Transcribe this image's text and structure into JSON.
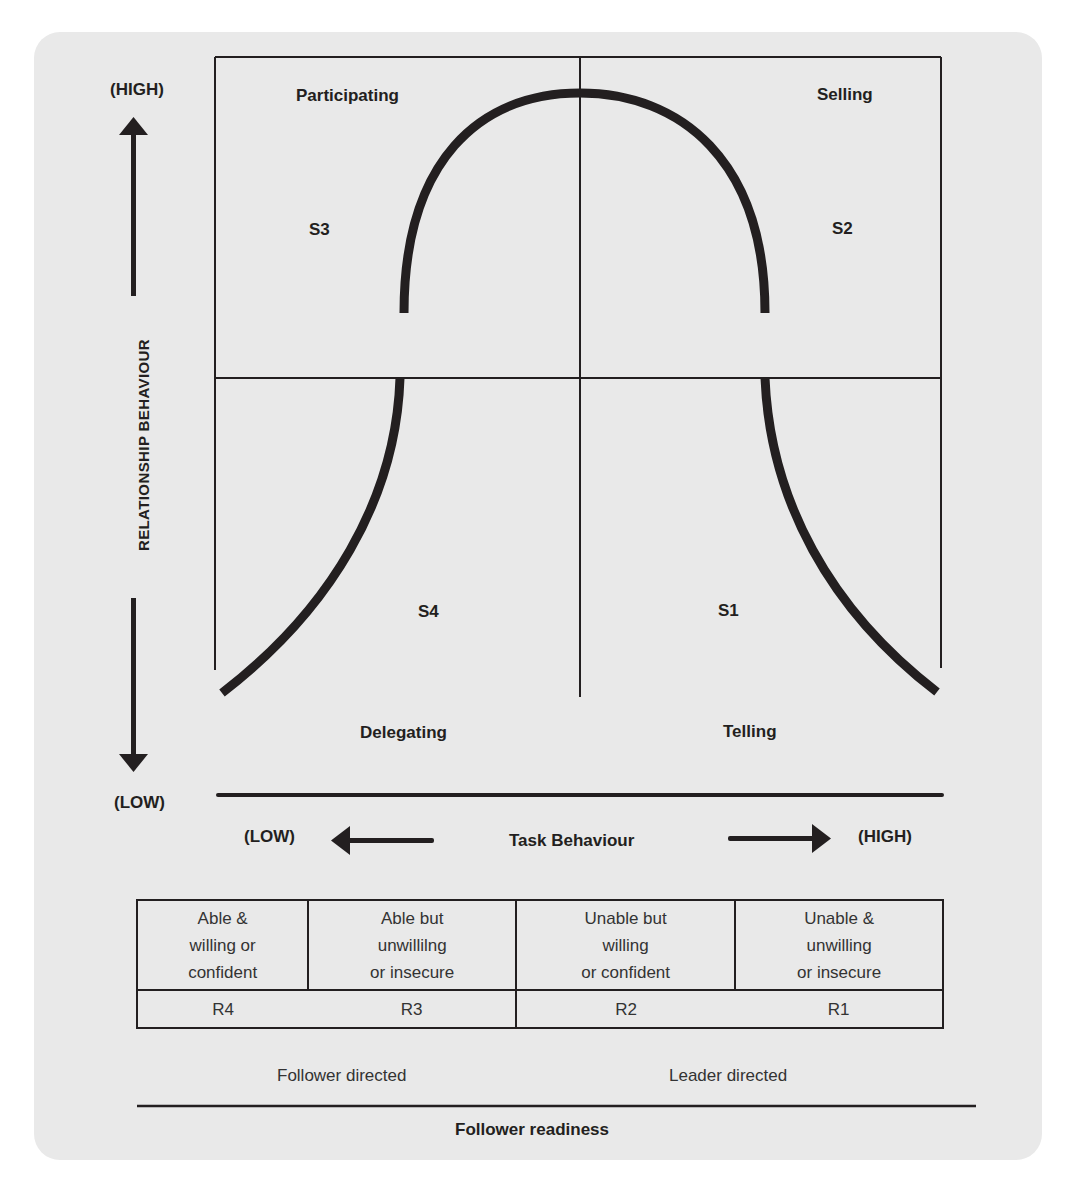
{
  "diagram": {
    "y_axis": {
      "label": "RELATIONSHIP BEHAVIOUR",
      "high": "(HIGH)",
      "low": "(LOW)",
      "icons": [
        "arrow-up-icon",
        "arrow-down-icon"
      ]
    },
    "x_axis": {
      "label": "Task Behaviour",
      "low": "(LOW)",
      "high": "(HIGH)",
      "icons": [
        "arrow-left-icon",
        "arrow-right-icon"
      ]
    },
    "quadrants": [
      {
        "id": "S3",
        "style": "Participating",
        "position": "top-left"
      },
      {
        "id": "S2",
        "style": "Selling",
        "position": "top-right"
      },
      {
        "id": "S4",
        "style": "Delegating",
        "position": "bottom-left"
      },
      {
        "id": "S1",
        "style": "Telling",
        "position": "bottom-right"
      }
    ],
    "readiness_table": {
      "descriptions": [
        [
          "Able &",
          "willing or",
          "confident"
        ],
        [
          "Able but",
          "unwillilng",
          "or insecure"
        ],
        [
          "Unable but",
          "willing",
          "or confident"
        ],
        [
          "Unable &",
          "unwilling",
          "or insecure"
        ]
      ],
      "codes": [
        "R4",
        "R3",
        "R2",
        "R1"
      ]
    },
    "direction": {
      "follower": "Follower directed",
      "leader": "Leader directed"
    },
    "footer_label": "Follower readiness",
    "colors": {
      "panel": "#e9e9e9",
      "ink": "#231f20"
    }
  }
}
